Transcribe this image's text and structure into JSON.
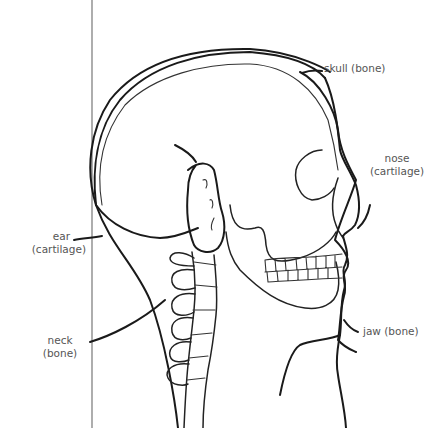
{
  "diagram": {
    "stroke_color": "#1a1a1a",
    "label_color": "#555555",
    "labels": {
      "skull": "skull (bone)",
      "nose_line1": "nose",
      "nose_line2": "(cartilage)",
      "ear_line1": "ear",
      "ear_line2": "(cartilage)",
      "neck_line1": "neck",
      "neck_line2": "(bone)",
      "jaw": "jaw (bone)"
    }
  }
}
